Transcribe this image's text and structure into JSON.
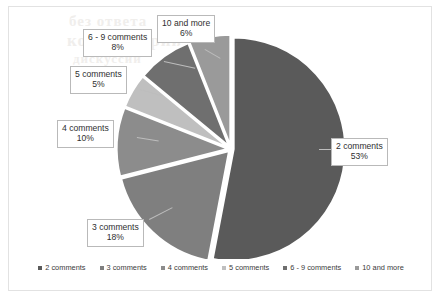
{
  "chart_data": {
    "type": "pie",
    "title": "",
    "categories": [
      "2 comments",
      "3 comments",
      "4 comments",
      "5 comments",
      "6 - 9 comments",
      "10 and more"
    ],
    "values": [
      53,
      18,
      10,
      5,
      8,
      6
    ],
    "value_labels": [
      "53%",
      "18%",
      "10%",
      "5%",
      "8%",
      "6%"
    ],
    "units": "percent",
    "colors": [
      "#5a5a5a",
      "#7f7f7f",
      "#8c8c8c",
      "#bfbfbf",
      "#6f6f6f",
      "#9a9a9a"
    ],
    "exploded": true,
    "legend_position": "bottom",
    "grid": false,
    "slices": [
      {
        "label": "2 comments",
        "percent_label": "53%",
        "value": 53,
        "color": "#5a5a5a"
      },
      {
        "label": "3 comments",
        "percent_label": "18%",
        "value": 18,
        "color": "#7f7f7f"
      },
      {
        "label": "4 comments",
        "percent_label": "10%",
        "value": 10,
        "color": "#8c8c8c"
      },
      {
        "label": "5 comments",
        "percent_label": "5%",
        "value": 5,
        "color": "#bfbfbf"
      },
      {
        "label": "6 - 9 comments",
        "percent_label": "8%",
        "value": 8,
        "color": "#6f6f6f"
      },
      {
        "label": "10 and more",
        "percent_label": "6%",
        "value": 6,
        "color": "#9a9a9a"
      }
    ]
  },
  "legend": {
    "items": [
      {
        "label": "2 comments",
        "color": "#5a5a5a"
      },
      {
        "label": "3 comments",
        "color": "#7f7f7f"
      },
      {
        "label": "4 comments",
        "color": "#8c8c8c"
      },
      {
        "label": "5 comments",
        "color": "#bfbfbf"
      },
      {
        "label": "6 - 9 comments",
        "color": "#6f6f6f"
      },
      {
        "label": "10 and more",
        "color": "#9a9a9a"
      }
    ]
  },
  "callouts": {
    "two": {
      "category": "2 comments",
      "percent": "53%"
    },
    "three": {
      "category": "3 comments",
      "percent": "18%"
    },
    "four": {
      "category": "4 comments",
      "percent": "10%"
    },
    "five": {
      "category": "5 comments",
      "percent": "5%"
    },
    "six_nine": {
      "category": "6 - 9 comments",
      "percent": "8%"
    },
    "ten_plus": {
      "category": "10 and more",
      "percent": "6%"
    }
  },
  "background_bleed": {
    "line1": "без ответа",
    "line2": "комментарии",
    "line3": "дискуссии"
  }
}
